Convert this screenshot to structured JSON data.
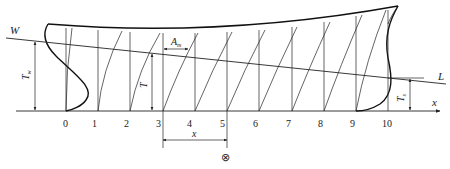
{
  "diagram": {
    "type": "ship-hull-profile-with-trim-waterline",
    "stations": [
      "0",
      "1",
      "2",
      "3",
      "4",
      "5",
      "6",
      "7",
      "8",
      "9",
      "10"
    ],
    "labels": {
      "waterline_left": "W",
      "waterline_right": "L",
      "draft_aft": "T",
      "draft_aft_sub": "w",
      "draft_mid": "T",
      "draft_fore": "T",
      "draft_fore_sub": "s",
      "area": "A",
      "area_sub": "m",
      "x_axis": "x",
      "dimension_x": "x",
      "midship_symbol": "⊗"
    },
    "colors": {
      "line": "#222222",
      "background": "#ffffff"
    }
  }
}
